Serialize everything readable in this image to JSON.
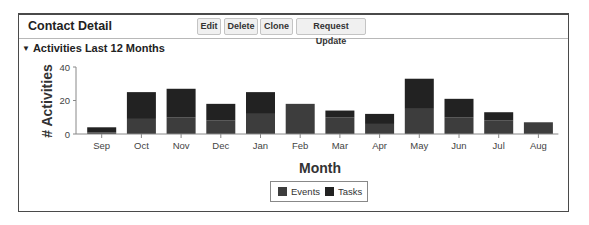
{
  "panel": {
    "title": "Contact Detail",
    "buttons": [
      {
        "label": "Edit"
      },
      {
        "label": "Delete"
      },
      {
        "label": "Clone"
      },
      {
        "label": "Request Update"
      }
    ]
  },
  "section": {
    "toggle_icon": "▼",
    "title": "Activities Last 12 Months"
  },
  "colors": {
    "events": "#3d3d3d",
    "tasks": "#222222",
    "axis": "#888888"
  },
  "chart_data": {
    "type": "bar",
    "stacked": true,
    "title": "",
    "xlabel": "Month",
    "ylabel": "# Activities",
    "ylim": [
      0,
      40
    ],
    "yticks": [
      0,
      20,
      40
    ],
    "grid": false,
    "legend_position": "bottom",
    "categories": [
      "Sep",
      "Oct",
      "Nov",
      "Dec",
      "Jan",
      "Feb",
      "Mar",
      "Apr",
      "May",
      "Jun",
      "Jul",
      "Aug"
    ],
    "series": [
      {
        "name": "Events",
        "values": [
          1,
          9,
          10,
          8,
          12,
          18,
          10,
          6,
          15,
          10,
          8,
          7
        ]
      },
      {
        "name": "Tasks",
        "values": [
          3,
          16,
          17,
          10,
          13,
          0,
          4,
          6,
          18,
          11,
          5,
          0
        ]
      }
    ]
  }
}
